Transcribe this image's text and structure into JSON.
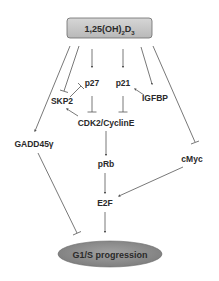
{
  "diagram": {
    "type": "signaling-pathway",
    "colors": {
      "box_fill": "#c8c8c8",
      "box_stroke": "#6a6a6a",
      "ellipse_fill": "#8e8e8e",
      "ellipse_stroke": "#6a6a6a",
      "edge": "#555555",
      "text": "#2a2a2a"
    },
    "nodes": {
      "vitd": {
        "label_main": "1,25(OH)",
        "label_sub1": "2",
        "label_mid": "D",
        "label_sub2": "3",
        "shape": "rounded-box"
      },
      "p27": {
        "label": "p27"
      },
      "p21": {
        "label": "p21"
      },
      "skp2": {
        "label": "SKP2"
      },
      "igfbp": {
        "label": "IGFBP"
      },
      "cdk2": {
        "label": "CDK2/CyclinE"
      },
      "gadd45": {
        "label": "GADD45γ"
      },
      "prb": {
        "label": "pRb"
      },
      "cmyc": {
        "label": "cMyc"
      },
      "e2f": {
        "label": "E2F"
      },
      "g1s": {
        "label": "G1/S progression",
        "shape": "ellipse"
      }
    },
    "edges": [
      {
        "from": "vitd",
        "to": "gadd45",
        "type": "activation"
      },
      {
        "from": "vitd",
        "to": "skp2",
        "type": "inhibition"
      },
      {
        "from": "vitd",
        "to": "p27",
        "type": "activation"
      },
      {
        "from": "vitd",
        "to": "p21",
        "type": "activation"
      },
      {
        "from": "vitd",
        "to": "igfbp",
        "type": "activation"
      },
      {
        "from": "vitd",
        "to": "cmyc",
        "type": "inhibition"
      },
      {
        "from": "skp2",
        "to": "p27",
        "type": "inhibition"
      },
      {
        "from": "igfbp",
        "to": "p21",
        "type": "activation"
      },
      {
        "from": "p27",
        "to": "cdk2",
        "type": "inhibition"
      },
      {
        "from": "p21",
        "to": "cdk2",
        "type": "inhibition"
      },
      {
        "from": "cdk2",
        "to": "skp2",
        "type": "activation"
      },
      {
        "from": "cdk2",
        "to": "prb",
        "type": "activation"
      },
      {
        "from": "prb",
        "to": "e2f",
        "type": "activation"
      },
      {
        "from": "cmyc",
        "to": "e2f",
        "type": "activation"
      },
      {
        "from": "e2f",
        "to": "g1s",
        "type": "activation"
      },
      {
        "from": "gadd45",
        "to": "g1s",
        "type": "inhibition"
      }
    ]
  }
}
